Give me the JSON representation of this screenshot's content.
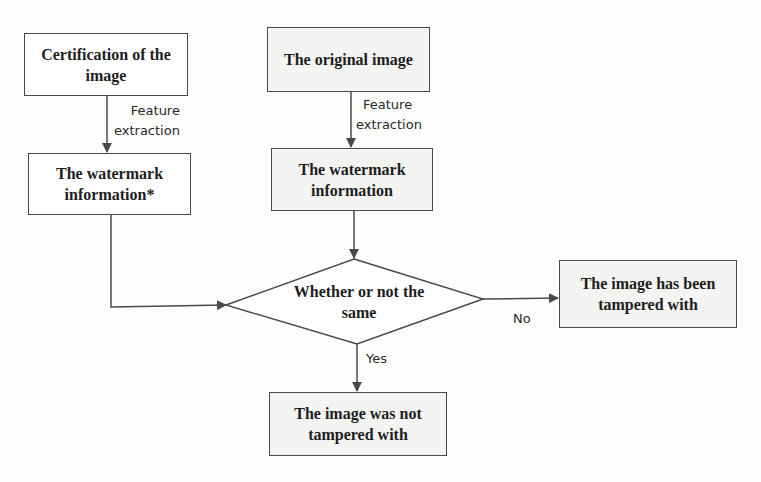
{
  "diagram": {
    "nodes": {
      "certification": {
        "label": "Certification of the image",
        "shape": "rectangle"
      },
      "watermark_left": {
        "label": "The watermark information*",
        "shape": "rectangle"
      },
      "original": {
        "label": "The original image",
        "shape": "rectangle"
      },
      "watermark_right": {
        "label": "The watermark information",
        "shape": "rectangle"
      },
      "decision": {
        "label": "Whether or not the same",
        "shape": "diamond"
      },
      "tampered": {
        "label": "The image has been tampered with",
        "shape": "rectangle"
      },
      "not_tampered": {
        "label": "The image was not tampered with",
        "shape": "rectangle"
      }
    },
    "edges": {
      "left_extraction": {
        "from": "certification",
        "to": "watermark_left",
        "line1": "Feature",
        "line2": "extraction"
      },
      "right_extraction": {
        "from": "original",
        "to": "watermark_right",
        "line1": "Feature",
        "line2": "extraction"
      },
      "left_to_decision": {
        "from": "watermark_left",
        "to": "decision",
        "label": ""
      },
      "right_to_decision": {
        "from": "watermark_right",
        "to": "decision",
        "label": ""
      },
      "no": {
        "from": "decision",
        "to": "tampered",
        "label": "No"
      },
      "yes": {
        "from": "decision",
        "to": "not_tampered",
        "label": "Yes"
      }
    },
    "colors": {
      "stroke": "#4a4a4a",
      "text": "#1e1e1e",
      "background": "#fdfdfc"
    }
  }
}
